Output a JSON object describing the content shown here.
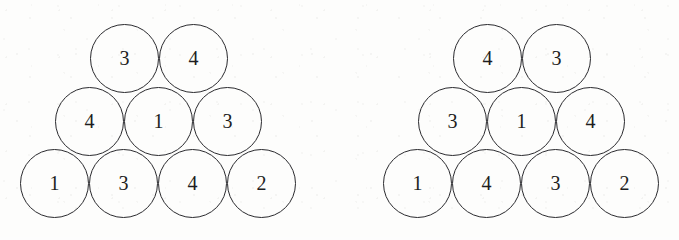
{
  "figure_type": "circle-packing-triangle-pair",
  "background_color": "#fdfdfd",
  "stroke_color": "#2a2a2e",
  "label_color": "#1d1d21",
  "circle_diameter_px": 69,
  "figures": [
    {
      "id": "left-arrangement",
      "name": "left-circle-pyramid",
      "origin_x": 20,
      "rows": [
        {
          "name": "top-row",
          "row_index": 0,
          "y": 24,
          "x_offset": 70,
          "circles": [
            {
              "value": "3",
              "x": 70,
              "y": 24
            },
            {
              "value": "4",
              "x": 139,
              "y": 24
            }
          ]
        },
        {
          "name": "middle-row",
          "row_index": 1,
          "y": 87,
          "x_offset": 35,
          "circles": [
            {
              "value": "4",
              "x": 35,
              "y": 87
            },
            {
              "value": "1",
              "x": 104,
              "y": 87
            },
            {
              "value": "3",
              "x": 173,
              "y": 87
            }
          ]
        },
        {
          "name": "bottom-row",
          "row_index": 2,
          "y": 149,
          "x_offset": 0,
          "circles": [
            {
              "value": "1",
              "x": 0,
              "y": 149
            },
            {
              "value": "3",
              "x": 69,
              "y": 149
            },
            {
              "value": "4",
              "x": 138,
              "y": 149
            },
            {
              "value": "2",
              "x": 207,
              "y": 149
            }
          ]
        }
      ]
    },
    {
      "id": "right-arrangement",
      "name": "right-circle-pyramid",
      "origin_x": 383,
      "rows": [
        {
          "name": "top-row",
          "row_index": 0,
          "y": 24,
          "x_offset": 70,
          "circles": [
            {
              "value": "4",
              "x": 70,
              "y": 24
            },
            {
              "value": "3",
              "x": 139,
              "y": 24
            }
          ]
        },
        {
          "name": "middle-row",
          "row_index": 1,
          "y": 87,
          "x_offset": 35,
          "circles": [
            {
              "value": "3",
              "x": 35,
              "y": 87
            },
            {
              "value": "1",
              "x": 104,
              "y": 87
            },
            {
              "value": "4",
              "x": 173,
              "y": 87
            }
          ]
        },
        {
          "name": "bottom-row",
          "row_index": 2,
          "y": 149,
          "x_offset": 0,
          "circles": [
            {
              "value": "1",
              "x": 0,
              "y": 149
            },
            {
              "value": "4",
              "x": 69,
              "y": 149
            },
            {
              "value": "3",
              "x": 138,
              "y": 149
            },
            {
              "value": "2",
              "x": 207,
              "y": 149
            }
          ]
        }
      ]
    }
  ]
}
